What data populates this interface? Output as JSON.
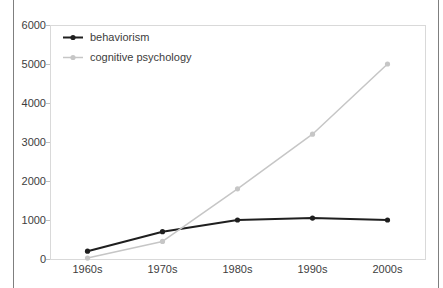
{
  "frame": {
    "border_color": "#7f7f7f"
  },
  "chart_data": {
    "type": "line",
    "categories": [
      "1960s",
      "1970s",
      "1980s",
      "1990s",
      "2000s"
    ],
    "series": [
      {
        "name": "behaviorism",
        "values": [
          200,
          700,
          1000,
          1050,
          1000
        ],
        "color": "#1f1f1f",
        "line_width": 2
      },
      {
        "name": "cognitive psychology",
        "values": [
          25,
          450,
          1800,
          3200,
          5000
        ],
        "color": "#c6c6c6",
        "line_width": 1.5
      }
    ],
    "title": "",
    "xlabel": "",
    "ylabel": "",
    "ylim": [
      0,
      6000
    ],
    "ytick_step": 1000,
    "yticklabels": [
      "0",
      "1000",
      "2000",
      "3000",
      "4000",
      "5000",
      "6000"
    ],
    "grid": false,
    "legend_position": "top-left-inside",
    "colors": {
      "plot_border": "#d9d9d9",
      "tick": "#bfbfbf",
      "text": "#3d3d3d"
    }
  }
}
